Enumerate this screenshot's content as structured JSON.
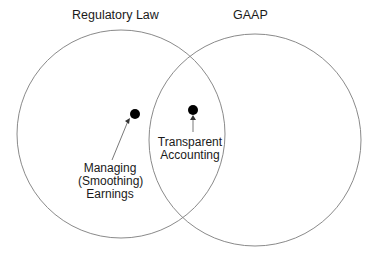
{
  "diagram": {
    "type": "venn",
    "sets": [
      {
        "label": "Regulatory Law"
      },
      {
        "label": "GAAP"
      }
    ],
    "points": [
      {
        "label_lines": [
          "Managing",
          "(Smoothing)",
          "Earnings"
        ],
        "region": "Regulatory Law only"
      },
      {
        "label_lines": [
          "Transparent",
          "Accounting"
        ],
        "region": "Regulatory Law ∩ GAAP"
      }
    ]
  }
}
